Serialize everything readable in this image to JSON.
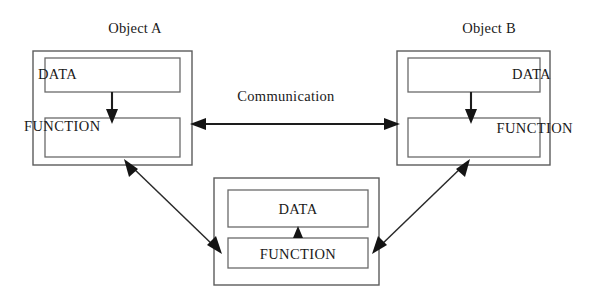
{
  "diagram": {
    "background_color": "#ffffff",
    "line_color": "#1d1d1d",
    "box_stroke_color": "#5c5c5c",
    "text_color": "#1a1a1a",
    "objects": [
      {
        "id": "object-a",
        "title": "Object A",
        "data_label": "DATA",
        "function_label": "FUNCTION",
        "label_align": "left",
        "internal_arrow_direction": "down"
      },
      {
        "id": "object-b",
        "title": "Object B",
        "data_label": "DATA",
        "function_label": "FUNCTION",
        "label_align": "right",
        "internal_arrow_direction": "down"
      },
      {
        "id": "object-c",
        "title": "",
        "data_label": "DATA",
        "function_label": "FUNCTION",
        "label_align": "center",
        "internal_arrow_direction": "up"
      }
    ],
    "connections": [
      {
        "id": "conn-a-b",
        "label": "Communication",
        "from": "object-a",
        "to": "object-b",
        "arrow_type": "double"
      },
      {
        "id": "conn-a-c",
        "label": "",
        "from": "object-a",
        "to": "object-c",
        "arrow_type": "double"
      },
      {
        "id": "conn-b-c",
        "label": "",
        "from": "object-b",
        "to": "object-c",
        "arrow_type": "double"
      }
    ]
  }
}
